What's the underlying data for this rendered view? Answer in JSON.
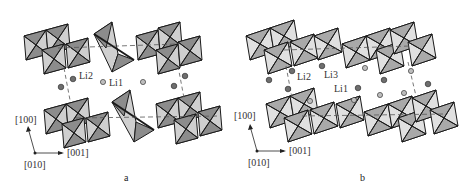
{
  "figure": {
    "panels": [
      {
        "id": "a",
        "caption": "a",
        "site_labels": [
          "Li2",
          "Li1"
        ],
        "axes": {
          "up": "[100]",
          "right": "[001]",
          "origin": "[010]"
        }
      },
      {
        "id": "b",
        "caption": "b",
        "site_labels": [
          "Li2",
          "Li3",
          "Li1"
        ],
        "axes": {
          "up": "[100]",
          "right": "[001]",
          "origin": "[010]"
        }
      }
    ],
    "colors": {
      "facet_dark": "#8c8c8c",
      "facet_light": "#cfcfcf",
      "edge": "#1a1a1a",
      "li_dark": "#6e6e6e",
      "li_light": "#bdbdbd",
      "dashed": "#555555"
    }
  }
}
